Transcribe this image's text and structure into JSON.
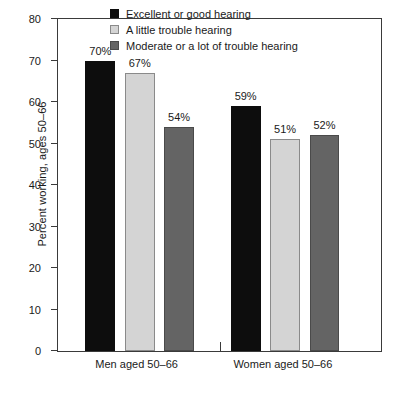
{
  "chart_data": {
    "type": "bar",
    "title": "",
    "xlabel": "",
    "ylabel": "Percent working, ages 50–66",
    "ylim": [
      0,
      80
    ],
    "yticks": [
      0,
      10,
      20,
      30,
      40,
      50,
      60,
      70,
      80
    ],
    "ytick_labels": [
      "0",
      "10",
      "20",
      "30",
      "40",
      "50",
      "60",
      "70",
      "80"
    ],
    "grid": false,
    "legend_position": "top-center",
    "categories": [
      "Men aged 50–66",
      "Women aged 50–66"
    ],
    "series": [
      {
        "name": "Excellent or good hearing",
        "color": "#0d0d0d",
        "values": [
          70,
          59
        ],
        "value_labels": [
          "70%",
          "59%"
        ]
      },
      {
        "name": "A little trouble hearing",
        "color": "#d4d4d4",
        "values": [
          67,
          51
        ],
        "value_labels": [
          "67%",
          "51%"
        ]
      },
      {
        "name": "Moderate or a lot of trouble hearing",
        "color": "#646464",
        "values": [
          54,
          52
        ],
        "value_labels": [
          "54%",
          "52%"
        ]
      }
    ]
  },
  "axes": {
    "y_title": "Percent working, ages 50–66",
    "y_tick_labels": [
      "80",
      "70",
      "60",
      "50",
      "40",
      "30",
      "20",
      "10",
      "0"
    ]
  },
  "legend": {
    "items": [
      {
        "label": "Excellent or good hearing",
        "swatch": "dark"
      },
      {
        "label": "A little trouble hearing",
        "swatch": "light"
      },
      {
        "label": "Moderate or a lot of trouble hearing",
        "swatch": "medium"
      }
    ]
  },
  "groups": [
    {
      "label": "Men aged 50–66"
    },
    {
      "label": "Women aged 50–66"
    }
  ]
}
